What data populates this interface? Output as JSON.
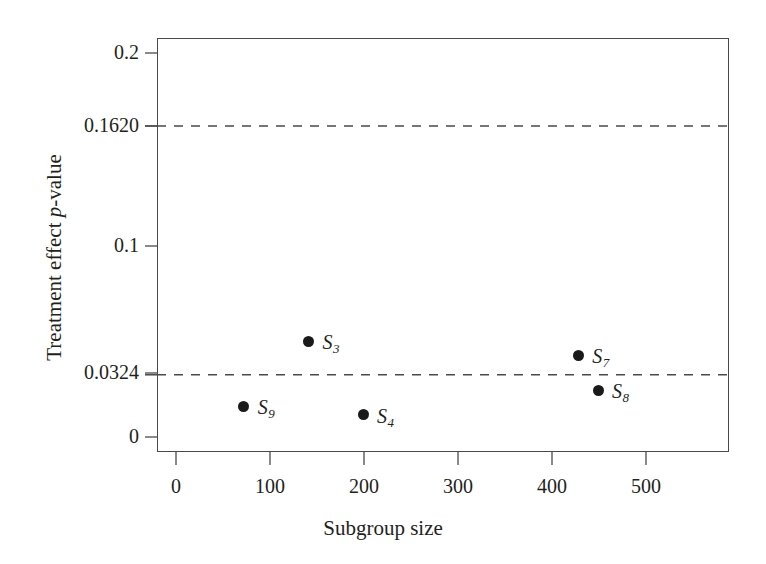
{
  "chart_data": {
    "type": "scatter",
    "title": "",
    "xlabel": "Subgroup size",
    "ylabel": "Treatment effect p-value",
    "ylabel_parts": {
      "pre": "Treatment effect ",
      "italic": "p",
      "post": "-value"
    },
    "xlim": [
      0,
      520
    ],
    "ylim": [
      0,
      0.21
    ],
    "grid": false,
    "legend": "none",
    "xticks": [
      0,
      100,
      200,
      300,
      400,
      500
    ],
    "xtick_labels": [
      "0",
      "100",
      "200",
      "300",
      "400",
      "500"
    ],
    "yticks": [
      0,
      0.0324,
      0.1,
      0.162,
      0.2
    ],
    "ytick_labels": [
      "0",
      "0.0324",
      "0.1",
      "0.2",
      "0.1620"
    ],
    "points": [
      {
        "label": "S",
        "sub": "9",
        "x": 72,
        "y": 0.016,
        "label_dx": 14,
        "label_dy": -9
      },
      {
        "label": "S",
        "sub": "3",
        "x": 141,
        "y": 0.05,
        "label_dx": 14,
        "label_dy": -9
      },
      {
        "label": "S",
        "sub": "4",
        "x": 199,
        "y": 0.0115,
        "label_dx": 14,
        "label_dy": -9
      },
      {
        "label": "S",
        "sub": "7",
        "x": 428,
        "y": 0.0425,
        "label_dx": 14,
        "label_dy": -9
      },
      {
        "label": "S",
        "sub": "8",
        "x": 449,
        "y": 0.0244,
        "label_dx": 14,
        "label_dy": -9
      }
    ],
    "reference_lines": [
      {
        "name": "upper-threshold",
        "value": 0.162,
        "style": "dashed",
        "color": "#4a4a4a"
      },
      {
        "name": "lower-threshold",
        "value": 0.0324,
        "style": "dashed",
        "color": "#4a4a4a"
      }
    ],
    "colors": {
      "point": "#1a1a1a",
      "axis": "#4a4a4a",
      "text": "#231f20",
      "background": "#ffffff"
    }
  },
  "ytick_positions": {
    "0": 437,
    "0.0324": 373,
    "0.1": 246,
    "0.1620": 126,
    "0.2": 53
  },
  "xtick_positions": {
    "0": 176,
    "100": 270,
    "200": 364,
    "300": 458,
    "400": 552,
    "500": 646
  }
}
